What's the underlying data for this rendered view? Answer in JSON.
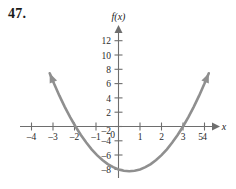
{
  "figure": {
    "problem_number": "47."
  },
  "chart_data": {
    "type": "line",
    "title": "",
    "subtitle": "",
    "xlabel": "x",
    "ylabel": "f(x)",
    "function_label": "f(x)",
    "axis_x_label": "x",
    "equation": "f(x) = x^2 - x - 6",
    "grid": false,
    "legend": "none",
    "xlim": [
      -4.8,
      5.6
    ],
    "ylim": [
      -8.8,
      13.6
    ],
    "xticks": [
      -4,
      -3,
      -2,
      -1,
      0,
      1,
      2,
      3,
      4,
      5
    ],
    "xtick_labels": [
      "–4",
      "–3",
      "–2",
      "–1",
      "0",
      "1",
      "2",
      "3",
      "4",
      "5"
    ],
    "yticks": [
      -8,
      -6,
      -4,
      -2,
      2,
      4,
      6,
      8,
      10,
      12
    ],
    "ytick_labels": [
      "–8",
      "–6",
      "–4",
      "–2",
      "2",
      "4",
      "6",
      "8",
      "10",
      "12"
    ],
    "origin_label": "0",
    "roots": [
      -2,
      3
    ],
    "vertex": [
      0.5,
      -6.25
    ],
    "y_intercept": -6,
    "series": [
      {
        "name": "f(x) = x^2 - x - 6",
        "color": "#8f8f8f",
        "x": [
          -3.2,
          -3.0,
          -2.75,
          -2.5,
          -2.25,
          -2.0,
          -1.75,
          -1.5,
          -1.25,
          -1.0,
          -0.75,
          -0.5,
          -0.25,
          0.0,
          0.25,
          0.5,
          0.75,
          1.0,
          1.25,
          1.5,
          1.75,
          2.0,
          2.25,
          2.5,
          2.75,
          3.0,
          3.25,
          3.5,
          3.75,
          4.0,
          4.2
        ],
        "y": [
          7.44,
          6.0,
          4.3125,
          2.75,
          1.3125,
          0.0,
          -1.1875,
          -2.25,
          -3.1875,
          -4.0,
          -4.6875,
          -5.25,
          -5.6875,
          -6.0,
          -6.1875,
          -6.25,
          -6.1875,
          -6.0,
          -5.6875,
          -5.25,
          -4.6875,
          -4.0,
          -3.1875,
          -2.25,
          -1.1875,
          0.0,
          1.3125,
          2.75,
          4.3125,
          6.0,
          7.44
        ],
        "arrow_start": true,
        "arrow_end": true
      }
    ],
    "colors": {
      "curve": "#8f8f8f",
      "axis": "#6e6e6e",
      "text": "#2a2a2a",
      "background": "#ffffff"
    }
  }
}
